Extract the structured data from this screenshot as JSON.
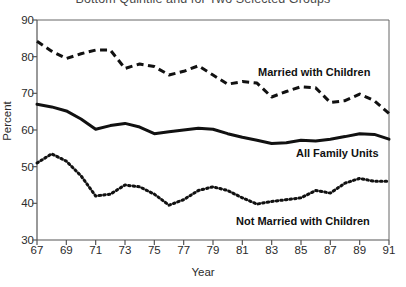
{
  "chart_data": {
    "type": "line",
    "title": "Bottom Quintile and for Two Selected Groups",
    "xlabel": "Year",
    "ylabel": "Percent",
    "ylim": [
      30,
      90
    ],
    "xlim": [
      67,
      91
    ],
    "ytick_labels": [
      "90",
      "80",
      "70",
      "60",
      "50",
      "40",
      "30"
    ],
    "ytick_values": [
      90,
      80,
      70,
      60,
      50,
      40,
      30
    ],
    "xtick_labels": [
      "67",
      "69",
      "71",
      "73",
      "75",
      "77",
      "79",
      "81",
      "83",
      "85",
      "87",
      "89",
      "91"
    ],
    "xtick_values": [
      67,
      69,
      71,
      73,
      75,
      77,
      79,
      81,
      83,
      85,
      87,
      89,
      91
    ],
    "grid": false,
    "legend_position": "inline-annotations",
    "x": [
      67,
      68,
      69,
      70,
      71,
      72,
      73,
      74,
      75,
      76,
      77,
      78,
      79,
      80,
      81,
      82,
      83,
      84,
      85,
      86,
      87,
      88,
      89,
      90,
      91
    ],
    "series": [
      {
        "name": "Married with Children",
        "style": "dashed",
        "color": "#111111",
        "values": [
          84.2,
          81.5,
          79.5,
          80.8,
          81.8,
          81.8,
          76.8,
          78.0,
          77.3,
          75.0,
          76.0,
          77.5,
          75.0,
          72.5,
          73.2,
          72.8,
          69.0,
          70.5,
          71.8,
          71.5,
          67.5,
          68.0,
          69.8,
          68.0,
          64.5
        ]
      },
      {
        "name": "All Family Units",
        "style": "solid",
        "color": "#111111",
        "values": [
          67.0,
          66.3,
          65.2,
          63.0,
          60.2,
          61.2,
          61.8,
          60.8,
          59.0,
          59.5,
          60.0,
          60.5,
          60.2,
          59.0,
          58.0,
          57.2,
          56.3,
          56.5,
          57.2,
          57.0,
          57.5,
          58.2,
          59.0,
          58.8,
          57.5
        ]
      },
      {
        "name": "Not Married with Children",
        "style": "dotted",
        "color": "#111111",
        "values": [
          51.0,
          53.5,
          51.5,
          47.5,
          42.0,
          42.5,
          45.0,
          44.5,
          42.5,
          39.5,
          41.0,
          43.5,
          44.5,
          43.5,
          41.5,
          39.8,
          40.5,
          41.0,
          41.5,
          43.5,
          42.8,
          45.5,
          46.8,
          46.0,
          46.0
        ]
      }
    ],
    "annotations": [
      {
        "text": "Married with Children",
        "x_px": 258,
        "y_px": 66
      },
      {
        "text": "All Family Units",
        "x_px": 296,
        "y_px": 147
      },
      {
        "text": "Not Married with Children",
        "x_px": 236,
        "y_px": 215
      }
    ]
  }
}
